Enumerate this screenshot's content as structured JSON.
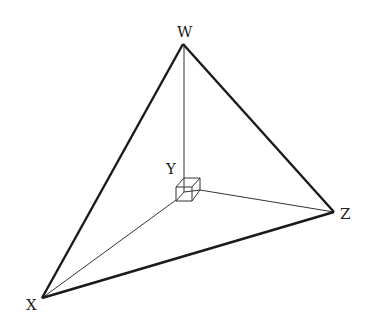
{
  "diagram": {
    "type": "tetrahedron-right-corner",
    "labels": {
      "W": "W",
      "X": "X",
      "Y": "Y",
      "Z": "Z"
    },
    "vertices": {
      "W": [
        183,
        44
      ],
      "X": [
        42,
        298
      ],
      "Y": [
        184,
        190
      ],
      "Z": [
        334,
        212
      ]
    },
    "edges": [
      {
        "from": "W",
        "to": "X",
        "style": "thick"
      },
      {
        "from": "W",
        "to": "Z",
        "style": "thick"
      },
      {
        "from": "X",
        "to": "Z",
        "style": "thick"
      },
      {
        "from": "W",
        "to": "Y",
        "style": "thin"
      },
      {
        "from": "X",
        "to": "Y",
        "style": "thin"
      },
      {
        "from": "Z",
        "to": "Y",
        "style": "thin"
      }
    ],
    "right_angle_marker": "cube at Y",
    "colors": {
      "line": "#1a1a1a",
      "label": "#222222",
      "background": "#ffffff"
    }
  }
}
